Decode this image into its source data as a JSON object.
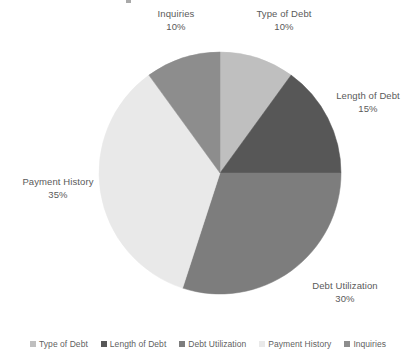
{
  "chart_data": {
    "type": "pie",
    "title": "",
    "xlabel": "",
    "ylabel": "",
    "legend_position": "bottom",
    "grid": false,
    "start_angle_deg": 0,
    "direction": "clockwise",
    "categories": [
      "Type of Debt",
      "Length of Debt",
      "Debt Utilization",
      "Payment History",
      "Inquiries"
    ],
    "values": [
      10,
      15,
      30,
      35,
      10
    ],
    "value_labels": [
      "10%",
      "15%",
      "30%",
      "35%",
      "10%"
    ],
    "unit": "%",
    "total": 100,
    "colors": [
      "#bfbfbf",
      "#575757",
      "#7d7d7d",
      "#e9e9e9",
      "#8d8d8d"
    ],
    "slices": [
      {
        "name": "Type of Debt",
        "value": 10,
        "value_label": "10%",
        "color": "#bfbfbf"
      },
      {
        "name": "Length of Debt",
        "value": 15,
        "value_label": "15%",
        "color": "#575757"
      },
      {
        "name": "Debt Utilization",
        "value": 30,
        "value_label": "30%",
        "color": "#7d7d7d"
      },
      {
        "name": "Payment History",
        "value": 35,
        "value_label": "35%",
        "color": "#e9e9e9"
      },
      {
        "name": "Inquiries",
        "value": 10,
        "value_label": "10%",
        "color": "#8d8d8d"
      }
    ]
  },
  "labels": {
    "inquiries": {
      "name": "Inquiries",
      "value": "10%"
    },
    "type_of_debt": {
      "name": "Type of Debt",
      "value": "10%"
    },
    "length_of_debt": {
      "name": "Length of Debt",
      "value": "15%"
    },
    "debt_utilization": {
      "name": "Debt Utilization",
      "value": "30%"
    },
    "payment_history": {
      "name": "Payment History",
      "value": "35%"
    }
  },
  "legend": {
    "items": [
      {
        "label": "Type of Debt",
        "color": "#bfbfbf"
      },
      {
        "label": "Length of Debt",
        "color": "#575757"
      },
      {
        "label": "Debt Utilization",
        "color": "#7d7d7d"
      },
      {
        "label": "Payment History",
        "color": "#e9e9e9"
      },
      {
        "label": "Inquiries",
        "color": "#8d8d8d"
      }
    ]
  }
}
